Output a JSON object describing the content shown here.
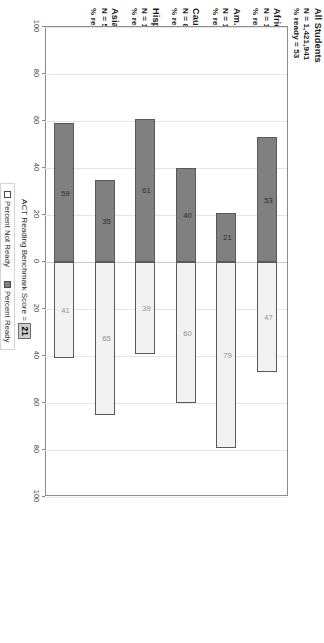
{
  "chart_data": {
    "type": "bar",
    "subtype": "diverging-stacked-bar",
    "title": "",
    "xlabel": "",
    "ylabel": "",
    "axis_annotation": "ACT Reading Benchmark Score =",
    "benchmark_score": "21",
    "categories": [
      "All Students",
      "African Am./Black",
      "Am. Indian/Alaska Native",
      "Caucasian Am./White",
      "Hispanic",
      "Asian Am./Pacific Islander"
    ],
    "series": [
      {
        "name": "Percent Ready",
        "values": [
          53,
          21,
          40,
          61,
          35,
          59
        ]
      },
      {
        "name": "Percent Not Ready",
        "values": [
          47,
          79,
          60,
          39,
          65,
          41
        ]
      }
    ],
    "group_n": [
      "1,421,941",
      "178,417",
      "14,380",
      "895,588",
      "114,697",
      "51,368"
    ],
    "n_prefix": "N =",
    "ready_prefix": "% ready =",
    "axis_ticks": [
      "100",
      "80",
      "60",
      "40",
      "20",
      "0",
      "20",
      "40",
      "60",
      "80",
      "100"
    ],
    "axis_tick_values": [
      100,
      80,
      60,
      40,
      20,
      0,
      -20,
      -40,
      -60,
      -80,
      -100
    ],
    "ylim": [
      -100,
      100
    ],
    "grid": true,
    "legend_position": "right",
    "colors": {
      "ready_fill": "#808080",
      "notready_fill": "#f2f2f2",
      "bar_border": "#595959",
      "grid": "#dcdce4",
      "frame": "#8c8c8c",
      "benchmark_box": "#cfcfcf"
    }
  },
  "legend": {
    "items": [
      {
        "label": "Percent Not Ready",
        "swatch": "notready"
      },
      {
        "label": "Percent Ready",
        "swatch": "ready"
      }
    ]
  }
}
